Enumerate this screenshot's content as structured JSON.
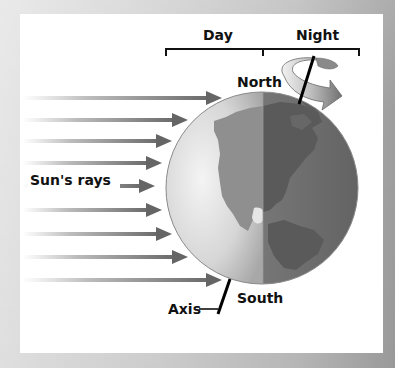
{
  "diagram": {
    "title_labels": {
      "day": "Day",
      "night": "Night"
    },
    "pole_labels": {
      "north": "North",
      "south": "South"
    },
    "rays_label": "Sun's rays",
    "axis_label": "Axis",
    "rays": {
      "count": 9,
      "y_positions": [
        98,
        120,
        141,
        163,
        186,
        210,
        234,
        257,
        280
      ],
      "tip_x": [
        222,
        188,
        172,
        162,
        155,
        162,
        172,
        188,
        222
      ]
    },
    "colors": {
      "background": "#c8c8c8",
      "panel": "#ffffff",
      "day_side": "#d9d9d9",
      "night_side": "#6f6f6f",
      "land_day": "#8c8c8c",
      "land_night": "#5a5a5a",
      "ray": "#6e6e6e",
      "text": "#111111"
    }
  }
}
